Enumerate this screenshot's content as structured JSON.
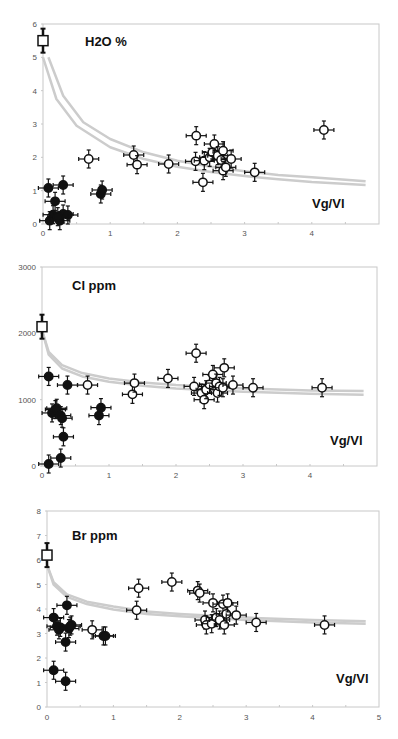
{
  "chart_data": [
    {
      "type": "scatter",
      "title": "H2O %",
      "xlabel": "Vg/Vl",
      "ylabel": "",
      "xlim": [
        0,
        5
      ],
      "ylim": [
        0,
        6
      ],
      "xticks": [
        "0",
        "1",
        "2",
        "3",
        "4"
      ],
      "yticks": [
        "0",
        "1",
        "2",
        "3",
        "4",
        "5",
        "6"
      ],
      "grid": false,
      "series": [
        {
          "name": "initial melt",
          "marker": "open-square",
          "points": [
            [
              0.0,
              5.5
            ]
          ]
        },
        {
          "name": "filled",
          "marker": "filled-circle",
          "points": [
            [
              0.08,
              1.08
            ],
            [
              0.3,
              1.17
            ],
            [
              0.18,
              0.68
            ],
            [
              0.15,
              0.28
            ],
            [
              0.1,
              0.1
            ],
            [
              0.25,
              0.1
            ],
            [
              0.3,
              0.3
            ],
            [
              0.37,
              0.27
            ],
            [
              0.22,
              0.22
            ],
            [
              0.86,
              0.9
            ],
            [
              0.88,
              1.02
            ]
          ]
        },
        {
          "name": "open",
          "marker": "open-circle",
          "points": [
            [
              0.68,
              1.95
            ],
            [
              1.35,
              2.07
            ],
            [
              1.4,
              1.78
            ],
            [
              1.87,
              1.8
            ],
            [
              2.27,
              1.88
            ],
            [
              2.28,
              2.65
            ],
            [
              2.38,
              1.25
            ],
            [
              2.4,
              1.9
            ],
            [
              2.48,
              2.0
            ],
            [
              2.52,
              2.15
            ],
            [
              2.55,
              2.4
            ],
            [
              2.6,
              2.05
            ],
            [
              2.65,
              1.92
            ],
            [
              2.68,
              2.2
            ],
            [
              2.68,
              1.6
            ],
            [
              2.72,
              1.7
            ],
            [
              2.8,
              1.95
            ],
            [
              3.15,
              1.55
            ],
            [
              4.18,
              2.82
            ]
          ]
        }
      ],
      "curves": [
        {
          "name": "model-upper",
          "color": "#cccccc",
          "x": [
            0.08,
            0.3,
            0.6,
            1.0,
            1.5,
            2.0,
            2.5,
            3.0,
            3.5,
            4.0,
            4.8
          ],
          "y": [
            5.0,
            3.85,
            3.05,
            2.55,
            2.15,
            1.9,
            1.72,
            1.58,
            1.47,
            1.4,
            1.28
          ]
        },
        {
          "name": "model-lower",
          "color": "#cccccc",
          "x": [
            0.0,
            0.2,
            0.5,
            1.0,
            1.5,
            2.0,
            2.5,
            3.0,
            3.5,
            4.0,
            4.8
          ],
          "y": [
            5.0,
            3.75,
            2.95,
            2.3,
            1.95,
            1.72,
            1.56,
            1.44,
            1.34,
            1.26,
            1.17
          ]
        }
      ]
    },
    {
      "type": "scatter",
      "title": "Cl ppm",
      "xlabel": "Vg/Vl",
      "ylabel": "",
      "xlim": [
        0,
        5
      ],
      "ylim": [
        0,
        3000
      ],
      "xticks": [
        "0",
        "1",
        "2",
        "3",
        "4"
      ],
      "yticks": [
        "0",
        "1000",
        "2000",
        "3000"
      ],
      "grid": false,
      "series": [
        {
          "name": "initial melt",
          "marker": "open-square",
          "points": [
            [
              0.0,
              2100
            ]
          ]
        },
        {
          "name": "filled",
          "marker": "filled-circle",
          "points": [
            [
              0.1,
              1350
            ],
            [
              0.38,
              1220
            ],
            [
              0.15,
              800
            ],
            [
              0.2,
              850
            ],
            [
              0.22,
              870
            ],
            [
              0.28,
              760
            ],
            [
              0.3,
              720
            ],
            [
              0.32,
              440
            ],
            [
              0.28,
              120
            ],
            [
              0.1,
              30
            ],
            [
              0.85,
              760
            ],
            [
              0.88,
              880
            ]
          ]
        },
        {
          "name": "open",
          "marker": "open-circle",
          "points": [
            [
              0.68,
              1220
            ],
            [
              1.35,
              1080
            ],
            [
              1.38,
              1250
            ],
            [
              1.88,
              1320
            ],
            [
              2.27,
              1200
            ],
            [
              2.3,
              1700
            ],
            [
              2.38,
              1100
            ],
            [
              2.42,
              1000
            ],
            [
              2.45,
              1150
            ],
            [
              2.5,
              1230
            ],
            [
              2.55,
              1380
            ],
            [
              2.6,
              1250
            ],
            [
              2.62,
              1100
            ],
            [
              2.65,
              1200
            ],
            [
              2.7,
              1180
            ],
            [
              2.72,
              1480
            ],
            [
              2.85,
              1220
            ],
            [
              3.15,
              1180
            ],
            [
              4.18,
              1180
            ]
          ]
        }
      ],
      "curves": [
        {
          "name": "model-upper",
          "color": "#cccccc",
          "x": [
            0.0,
            0.1,
            0.3,
            0.6,
            1.0,
            1.5,
            2.0,
            3.0,
            4.0,
            4.8
          ],
          "y": [
            2050,
            1720,
            1520,
            1400,
            1320,
            1260,
            1220,
            1170,
            1140,
            1130
          ]
        },
        {
          "name": "model-lower",
          "color": "#cccccc",
          "x": [
            0.0,
            0.1,
            0.3,
            0.6,
            1.0,
            1.5,
            2.0,
            3.0,
            4.0,
            4.8
          ],
          "y": [
            2050,
            1680,
            1470,
            1350,
            1270,
            1210,
            1170,
            1120,
            1090,
            1075
          ]
        }
      ]
    },
    {
      "type": "scatter",
      "title": "Br ppm",
      "xlabel": "Vg/Vl",
      "ylabel": "",
      "xlim": [
        0,
        5
      ],
      "ylim": [
        0,
        8
      ],
      "xticks": [
        "0",
        "1",
        "2",
        "3",
        "4",
        "5"
      ],
      "yticks": [
        "0",
        "1",
        "2",
        "3",
        "4",
        "5",
        "6",
        "7",
        "8"
      ],
      "grid": false,
      "series": [
        {
          "name": "initial melt",
          "marker": "open-square",
          "points": [
            [
              0.0,
              6.2
            ]
          ]
        },
        {
          "name": "filled",
          "marker": "filled-circle",
          "points": [
            [
              0.1,
              3.65
            ],
            [
              0.15,
              3.3
            ],
            [
              0.2,
              3.25
            ],
            [
              0.18,
              3.15
            ],
            [
              0.3,
              4.15
            ],
            [
              0.33,
              3.2
            ],
            [
              0.37,
              3.35
            ],
            [
              0.35,
              3.3
            ],
            [
              0.28,
              2.65
            ],
            [
              0.1,
              1.5
            ],
            [
              0.28,
              1.05
            ],
            [
              0.85,
              2.9
            ],
            [
              0.88,
              2.9
            ]
          ]
        },
        {
          "name": "open",
          "marker": "open-circle",
          "points": [
            [
              0.68,
              3.15
            ],
            [
              1.35,
              3.95
            ],
            [
              1.38,
              4.85
            ],
            [
              1.88,
              5.1
            ],
            [
              2.27,
              4.75
            ],
            [
              2.3,
              4.65
            ],
            [
              2.38,
              3.55
            ],
            [
              2.4,
              3.35
            ],
            [
              2.48,
              3.4
            ],
            [
              2.5,
              4.25
            ],
            [
              2.55,
              3.65
            ],
            [
              2.6,
              3.55
            ],
            [
              2.65,
              4.2
            ],
            [
              2.67,
              3.35
            ],
            [
              2.7,
              3.8
            ],
            [
              2.72,
              4.25
            ],
            [
              2.85,
              3.75
            ],
            [
              3.15,
              3.45
            ],
            [
              4.18,
              3.35
            ]
          ]
        }
      ],
      "curves": [
        {
          "name": "model-upper",
          "color": "#cccccc",
          "x": [
            0.0,
            0.1,
            0.3,
            0.6,
            1.0,
            1.5,
            2.0,
            3.0,
            4.0,
            4.8
          ],
          "y": [
            5.8,
            5.1,
            4.6,
            4.3,
            4.1,
            3.9,
            3.8,
            3.65,
            3.55,
            3.5
          ]
        },
        {
          "name": "model-lower",
          "color": "#cccccc",
          "x": [
            0.0,
            0.1,
            0.3,
            0.6,
            1.0,
            1.5,
            2.0,
            3.0,
            4.0,
            4.8
          ],
          "y": [
            5.8,
            5.0,
            4.5,
            4.2,
            3.98,
            3.8,
            3.7,
            3.55,
            3.45,
            3.4
          ]
        }
      ]
    }
  ]
}
